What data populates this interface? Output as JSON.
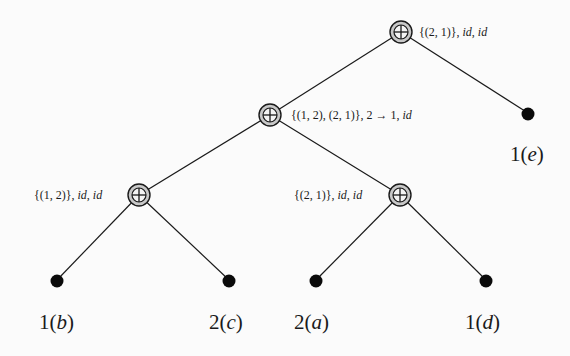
{
  "diagram": {
    "type": "tree",
    "colors": {
      "line": "#1a1a1a",
      "operator_fill": "#c8c8c8",
      "leaf_fill": "#0a0a0a",
      "background": "#fbfbfb"
    },
    "operator_symbol": "⊕",
    "nodes": [
      {
        "id": "root",
        "kind": "operator",
        "label": "{(2, 1)}, id, id",
        "label_parts": [
          "{(2, 1)}, ",
          "id",
          ", ",
          "id"
        ]
      },
      {
        "id": "mid",
        "kind": "operator",
        "label": "{(1, 2), (2, 1)}, 2 → 1, id",
        "label_parts": [
          "{(1, 2), (2, 1)}, 2 → 1, ",
          "id"
        ]
      },
      {
        "id": "left",
        "kind": "operator",
        "label": "{(1, 2)}, id, id",
        "label_parts": [
          "{(1, 2)}, ",
          "id",
          ", ",
          "id"
        ]
      },
      {
        "id": "right",
        "kind": "operator",
        "label": "{(2, 1)}, id, id",
        "label_parts": [
          "{(2, 1)}, ",
          "id",
          ", ",
          "id"
        ]
      },
      {
        "id": "leaf_b",
        "kind": "leaf",
        "label": "1(b)",
        "num": "1",
        "var": "b"
      },
      {
        "id": "leaf_c",
        "kind": "leaf",
        "label": "2(c)",
        "num": "2",
        "var": "c"
      },
      {
        "id": "leaf_a",
        "kind": "leaf",
        "label": "2(a)",
        "num": "2",
        "var": "a"
      },
      {
        "id": "leaf_d",
        "kind": "leaf",
        "label": "1(d)",
        "num": "1",
        "var": "d"
      },
      {
        "id": "leaf_e",
        "kind": "leaf",
        "label": "1(e)",
        "num": "1",
        "var": "e"
      }
    ],
    "edges": [
      [
        "root",
        "mid"
      ],
      [
        "root",
        "leaf_e"
      ],
      [
        "mid",
        "left"
      ],
      [
        "mid",
        "right"
      ],
      [
        "left",
        "leaf_b"
      ],
      [
        "left",
        "leaf_c"
      ],
      [
        "right",
        "leaf_a"
      ],
      [
        "right",
        "leaf_d"
      ]
    ]
  }
}
